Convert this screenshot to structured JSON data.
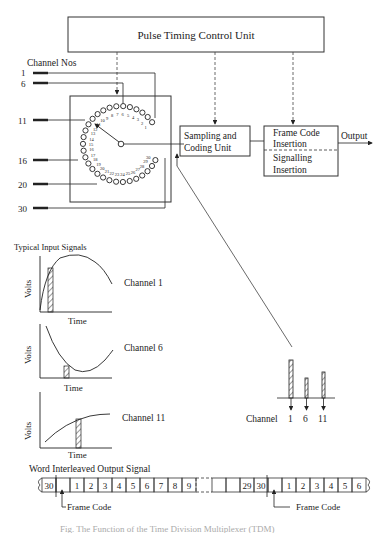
{
  "top_block": {
    "label": "Pulse Timing Control Unit"
  },
  "channel_header": "Channel Nos",
  "channel_inputs": [
    "1",
    "6",
    "11",
    "16",
    "20",
    "30"
  ],
  "commutator": {
    "contacts": [
      "1",
      "2",
      "3",
      "4",
      "5",
      "6",
      "7",
      "8",
      "9",
      "10",
      "11",
      "12",
      "13",
      "14",
      "15",
      "16",
      "17",
      "18",
      "19",
      "20",
      "21",
      "22",
      "23",
      "24",
      "25",
      "26",
      "27",
      "28",
      "29",
      "30"
    ]
  },
  "sampling_block": {
    "line1": "Sampling and",
    "line2": "Coding Unit"
  },
  "frame_block": {
    "top_line1": "Frame Code",
    "top_line2": "Insertion",
    "bottom_line1": "Signalling",
    "bottom_line2": "Insertion"
  },
  "output_label": "Output",
  "signals": {
    "title": "Typical Input Signals",
    "y_axis": "Volts",
    "x_axis": "Time",
    "channels": [
      "Channel 1",
      "Channel 6",
      "Channel 11"
    ]
  },
  "samples": {
    "label": "Channel",
    "ticks": [
      "1",
      "6",
      "11"
    ]
  },
  "output_signal": {
    "title": "Word Interleaved Output Signal",
    "cells_left": [
      "30",
      "",
      "1",
      "2",
      "3",
      "4",
      "5",
      "6",
      "7",
      "8",
      "9"
    ],
    "cells_right": [
      "",
      "",
      "29",
      "30",
      "",
      "1",
      "2",
      "3",
      "4",
      "5",
      "6"
    ],
    "frame_code_label": "Frame Code"
  },
  "caption": "Fig. The Function of the Time Division Multiplexer (TDM)"
}
